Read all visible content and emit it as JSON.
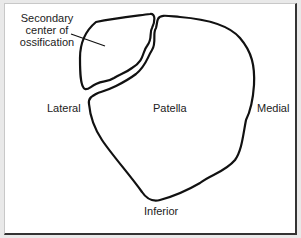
{
  "figure": {
    "labels": {
      "secondary_line1": "Secondary",
      "secondary_line2": "center of",
      "secondary_line3": "ossification",
      "lateral": "Lateral",
      "patella": "Patella",
      "medial": "Medial",
      "inferior": "Inferior"
    },
    "colors": {
      "stroke": "#111111",
      "background": "#ffffff",
      "frame_shadow": "#333333"
    }
  }
}
